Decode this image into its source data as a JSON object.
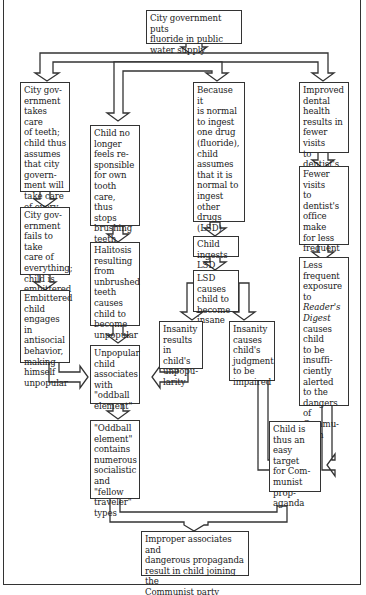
{
  "diagram": {
    "type": "flowchart",
    "nodes": {
      "start": "City government puts\nfluoride in public\nwater supply",
      "a1": "City gov-\nernment\ntakes care\nof teeth;\nchild thus\nassumes\nthat city\ngovern-\nment will\ntake care\nof every-\nthing",
      "a2": "City gov-\nernment\nfails to take\ncare of\neverything;\nchild is\nembittered",
      "a3": "Embittered\nchild\nengages in\nantisocial\nbehavior,\nmaking\nhimself\nunpopular",
      "b1": "Child no\nlonger\nfeels re-\nsponsible\nfor own\ntooth care,\nthus stops\nbrushing\nteeth",
      "b2": "Halitosis\nresulting\nfrom\nunbrushed\nteeth\ncauses\nchild to\nbecome\nunpopular",
      "b3": "Unpopular\nchild\nassociates\nwith\n\"oddball\nelement\"",
      "b4": "\"Oddball\nelement\"\ncontains\nnumerous\nsocialistic\nand \"fellow\ntraveler\"\ntypes",
      "c1": "Because it\nis normal\nto ingest\none drug\n(fluoride),\nchild\nassumes\nthat it is\nnormal to\ningest\nother drugs\n(LSD)",
      "c2": "Child\ningests\nLSD",
      "c3": "LSD\ncauses\nchild to\nbecome\ninsane",
      "c4": "Insanity\nresults in\nchild's\nunpopu-\nlarity",
      "c5": "Insanity\ncauses\nchild's\njudgment\nto be\nimpaired",
      "d1": "Improved\ndental\nhealth\nresults in\nfewer visits\nto dentist's\noffice",
      "d2_pre": "Fewer visits\nto dentist's\noffice make\nfor less\nfrequent\nexposure to\n",
      "d2_em": "Reader's\nDigest",
      "d3_pre": "Less\nfrequent\nexposure to\n",
      "d3_em": "Reader's\nDigest",
      "d3_post": "\ncauses child\nto be\ninsuffi-\nciently\nalerted\nto the\ndangers of\nCommu-\nnism",
      "d4": "Child  is\nthus an\neasy target\nfor Com-\nmunist\nprop-\naganda",
      "end": "Improper associates and\ndangerous propaganda\nresult in child joining the\nCommunist party"
    },
    "edges": [
      [
        "start",
        "a1"
      ],
      [
        "start",
        "b1"
      ],
      [
        "start",
        "c1"
      ],
      [
        "start",
        "d1"
      ],
      [
        "a1",
        "a2"
      ],
      [
        "a2",
        "a3"
      ],
      [
        "a3",
        "b3"
      ],
      [
        "b1",
        "b2"
      ],
      [
        "b2",
        "b3"
      ],
      [
        "b3",
        "b4"
      ],
      [
        "c1",
        "c2"
      ],
      [
        "c2",
        "c3"
      ],
      [
        "c3",
        "c4"
      ],
      [
        "c3",
        "c5"
      ],
      [
        "c4",
        "b3"
      ],
      [
        "c5",
        "d4"
      ],
      [
        "d1",
        "d2"
      ],
      [
        "d2",
        "d3"
      ],
      [
        "d3",
        "d4"
      ],
      [
        "b4",
        "end"
      ],
      [
        "d4",
        "end"
      ]
    ],
    "colors": {
      "line": "#333333",
      "background": "#ffffff"
    }
  }
}
